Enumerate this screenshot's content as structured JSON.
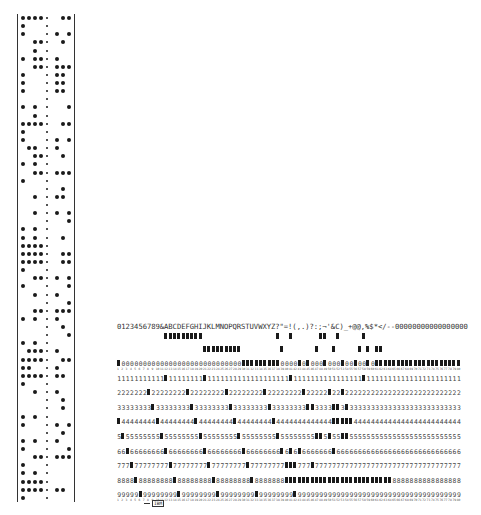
{
  "paper_tape": {
    "channels": 8,
    "rows": 60,
    "pattern": [
      "1111s.11",
      "1...s...",
      "1...s1.1",
      "..11s.1.",
      "..1.s...",
      "1.11s1..",
      "..11s111",
      "1...s11.",
      "1...s11.",
      "1...s11.",
      "....s...",
      "1.1.s..1",
      "..1.s...",
      "1111s.11",
      "1...s...",
      "1...s1.1",
      ".11.s1..",
      "..11s.1.",
      "1.1.s...",
      "..11s111",
      "1...s...",
      "....s.1.",
      "..1.s11.",
      "....s...",
      "..1.s1.1",
      "....s..1",
      "1.1.s...",
      "1.1.s.1.",
      "1111s...",
      "1111s.11",
      "1111s.11",
      "1...s...",
      "..11s1.1",
      "1...s..1",
      "..1.s1..",
      "....s..1",
      "..11s111",
      "1.1.s1..",
      "....s.1.",
      "....s..1",
      "1.1.s...",
      ".111s1..",
      "1111s.11",
      "11..s1..",
      "1111s11.",
      "1...s...",
      "..1.s1..",
      "....s.1.",
      "....s.1.",
      "1.1.s...",
      "1...s1.1",
      "....s.1.",
      "1.1.s1..",
      "1...s..1",
      "..11s111",
      "1...s...",
      "1.1.s...",
      "1111s...",
      "1111s11.",
      "1...s..."
    ]
  },
  "punched_card": {
    "printed_header": "0123456789&ABCDEFGHIJKLMNOPQRSTUVWXYZ?\"=!(,.)?:;¬'&C)_+@@,%$*</--00000000000000000",
    "row_labels": [
      "12",
      "11",
      "0",
      "1",
      "2",
      "3",
      "4",
      "5",
      "6",
      "7",
      "8",
      "9"
    ],
    "digit_rows": [
      "0",
      "1",
      "2",
      "3",
      "4",
      "5",
      "6",
      "7",
      "8",
      "9"
    ],
    "columns": 80,
    "bottom_label": "IBM",
    "punches": {
      "12": [
        11,
        12,
        13,
        14,
        15,
        16,
        17,
        18,
        19,
        37,
        40,
        47,
        48,
        51,
        57
      ],
      "11": [
        20,
        21,
        22,
        23,
        24,
        25,
        26,
        27,
        28,
        38,
        46,
        50,
        56,
        58,
        60,
        61
      ],
      "0": [
        0,
        29,
        30,
        31,
        32,
        33,
        34,
        35,
        36,
        37,
        42,
        44,
        48,
        52,
        55,
        58,
        60,
        61,
        62,
        63,
        64,
        65,
        66,
        67,
        68,
        69,
        70,
        71,
        72,
        73,
        74,
        75,
        76,
        77,
        78,
        79
      ],
      "1": [
        11,
        20,
        40,
        57
      ],
      "2": [
        7,
        16,
        25,
        34,
        43,
        49,
        52
      ],
      "3": [
        8,
        17,
        26,
        35,
        44,
        45,
        50,
        51,
        53
      ],
      "4": [
        0,
        9,
        18,
        27,
        36,
        50,
        51,
        52,
        53,
        54
      ],
      "5": [
        1,
        10,
        19,
        28,
        37,
        46,
        47,
        49,
        52,
        53
      ],
      "6": [
        2,
        11,
        20,
        29,
        38,
        40,
        42,
        50
      ],
      "7": [
        3,
        12,
        21,
        30,
        39,
        40,
        41,
        45
      ],
      "8": [
        4,
        13,
        22,
        31,
        39,
        40,
        41,
        42,
        43,
        44,
        45,
        46,
        47,
        48,
        49,
        50,
        51,
        52,
        53,
        54,
        55,
        56,
        57,
        58,
        59,
        60,
        61,
        62,
        63
      ],
      "9": [
        5,
        14,
        23,
        32,
        41
      ]
    }
  }
}
